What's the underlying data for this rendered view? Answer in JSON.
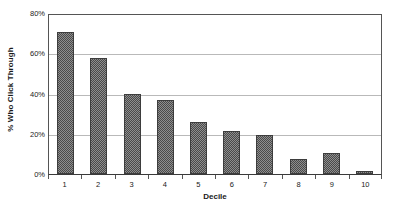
{
  "chart_data": {
    "type": "bar",
    "title": "",
    "subtitle": "",
    "xlabel": "Decile",
    "ylabel": "% Who Click Through",
    "categories": [
      "1",
      "2",
      "3",
      "4",
      "5",
      "6",
      "7",
      "8",
      "9",
      "10"
    ],
    "values": [
      71,
      58,
      40,
      37,
      26,
      21.5,
      19.5,
      7.5,
      10.5,
      1.5
    ],
    "series": [
      {
        "name": "% Who Click Through",
        "values": [
          71,
          58,
          40,
          37,
          26,
          21.5,
          19.5,
          7.5,
          10.5,
          1.5
        ]
      }
    ],
    "ylim": [
      0,
      80
    ],
    "ytick_values": [
      0,
      20,
      40,
      60,
      80
    ],
    "ytick_labels": [
      "0%",
      "20%",
      "40%",
      "60%",
      "80%"
    ],
    "xtick_labels": [
      "1",
      "2",
      "3",
      "4",
      "5",
      "6",
      "7",
      "8",
      "9",
      "10"
    ],
    "grid": true,
    "grid_axis": "y",
    "legend": false,
    "legend_position": "none",
    "annotations": [],
    "colors": {
      "background": "#ffffff",
      "plot_background": "#ffffff",
      "bar_fill": "#8e8e8e",
      "bar_pattern": "#4a4a4a",
      "bar_border": "#3d3d3d",
      "gridline": "#b9b9b9",
      "axis_line": "#555555",
      "text": "#1a1a1a"
    }
  }
}
